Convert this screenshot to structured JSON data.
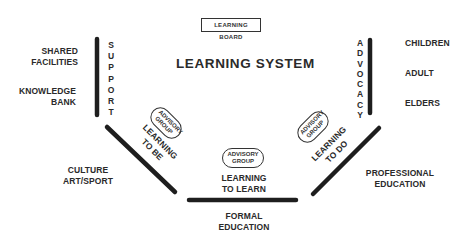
{
  "header": {
    "board_label": "LEARNING BOARD",
    "title": "LEARNING SYSTEM"
  },
  "left": {
    "vertical_label": [
      "S",
      "U",
      "P",
      "P",
      "O",
      "R",
      "T"
    ],
    "items": [
      {
        "line1": "SHARED",
        "line2": "FACILITIES"
      },
      {
        "line1": "KNOWLEDGE",
        "line2": "BANK"
      }
    ]
  },
  "right": {
    "vertical_label": [
      "A",
      "D",
      "V",
      "O",
      "C",
      "A",
      "C",
      "Y"
    ],
    "items": [
      "CHILDREN",
      "ADULT",
      "ELDERS"
    ]
  },
  "segments": {
    "be": {
      "line1": "LEARNING",
      "line2": "TO BE",
      "group": {
        "line1": "ADVISORY",
        "line2": "GROUP"
      },
      "outer": {
        "line1": "CULTURE",
        "line2": "ART/SPORT"
      }
    },
    "learn": {
      "line1": "LEARNING",
      "line2": "TO LEARN",
      "group": {
        "line1": "ADVISORY",
        "line2": "GROUP"
      },
      "outer": {
        "line1": "FORMAL",
        "line2": "EDUCATION"
      }
    },
    "do": {
      "line1": "LEARNING",
      "line2": "TO DO",
      "group": {
        "line1": "ADVISORY",
        "line2": "GROUP"
      },
      "outer": {
        "line1": "PROFESSIONAL",
        "line2": "EDUCATION"
      }
    }
  },
  "colors": {
    "line": "#1e1e1e",
    "text": "#2a2a2a",
    "background": "#ffffff"
  }
}
